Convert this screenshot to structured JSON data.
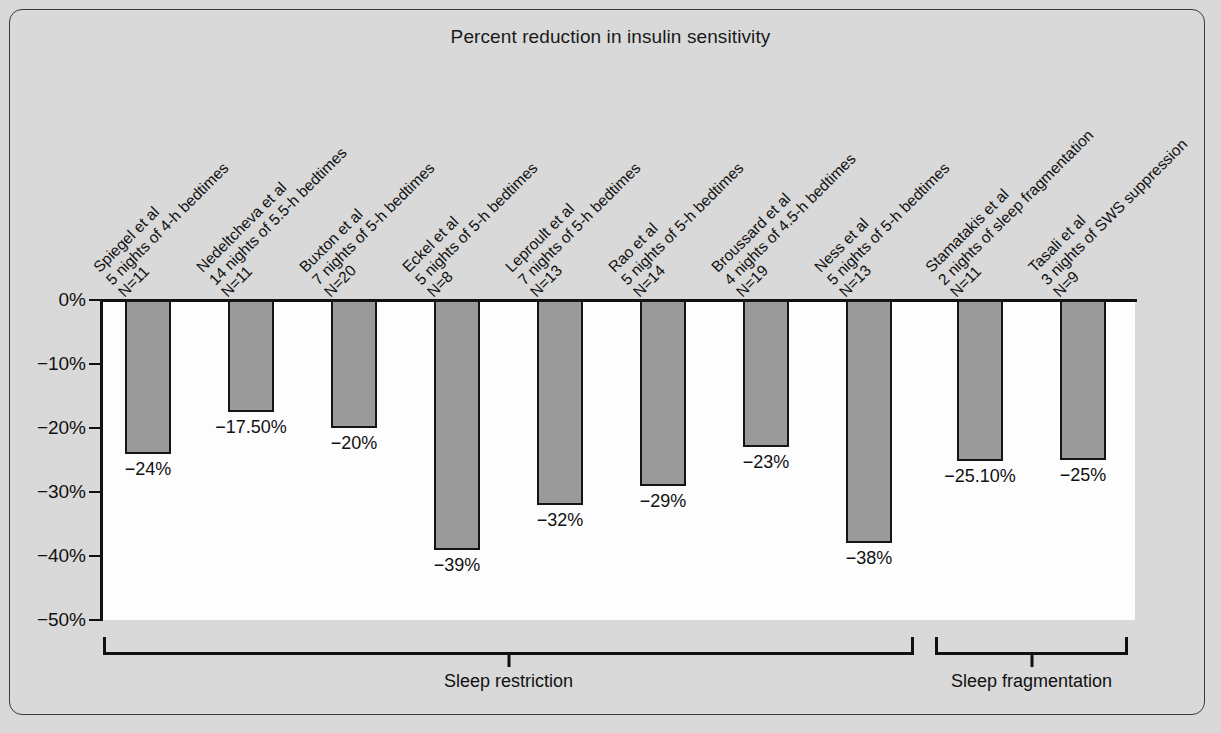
{
  "figure": {
    "background_color": "#d9d9d9",
    "plot_background_color": "#fdfdfd",
    "bar_fill_color": "#9a9a9a",
    "bar_edge_color": "#151515"
  },
  "chart_data": {
    "type": "bar",
    "title": "Percent reduction in insulin sensitivity",
    "xlabel": "",
    "ylabel": "",
    "ylim": [
      -50,
      0
    ],
    "grid": false,
    "legend": "none",
    "ytick_labels": [
      "0%",
      "−10%",
      "−20%",
      "−30%",
      "−40%",
      "−50%"
    ],
    "ytick_values": [
      0,
      -10,
      -20,
      -30,
      -40,
      -50
    ],
    "categories": [
      "Spiegel et al\n5 nights of 4-h bedtimes\nN=11",
      "Nedeltcheva et al\n14 nights of 5.5-h bedtimes\nN=11",
      "Buxton et al\n7 nights of 5-h bedtimes\nN=20",
      "Eckel et al\n5 nights of 5-h bedtimes\nN=8",
      "Leproult et al\n7 nights of 5-h bedtimes\nN=13",
      "Rao et al\n5 nights of 5-h bedtimes\nN=14",
      "Broussard et al\n4 nights of 4.5-h bedtimes\nN=19",
      "Ness et al\n5 nights of 5-h bedtimes\nN=13",
      "Stamatakis et al\n2 nights of sleep fragmentation\nN=11",
      "Tasali et al\n3 nights of SWS suppression\nN=9"
    ],
    "values": [
      -24,
      -17.5,
      -20,
      -39,
      -32,
      -29,
      -23,
      -38,
      -25.1,
      -25
    ],
    "data_labels": [
      "−24%",
      "−17.50%",
      "−20%",
      "−39%",
      "−32%",
      "−29%",
      "−23%",
      "−38%",
      "−25.10%",
      "−25%"
    ],
    "groups": [
      {
        "label": "Sleep restriction",
        "first_index": 0,
        "last_index": 7
      },
      {
        "label": "Sleep fragmentation",
        "first_index": 8,
        "last_index": 9
      }
    ]
  }
}
